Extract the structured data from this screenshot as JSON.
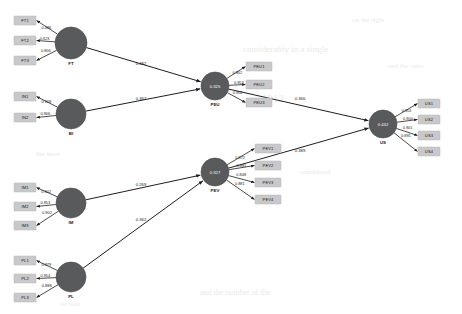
{
  "diagram": {
    "type": "pls-sem-path-model",
    "background_color": "#ffffff",
    "node_color": "#595a5c",
    "indicator_color": "#c9c9cb",
    "edge_color": "#1e1e20"
  },
  "ghost_text": [
    {
      "text": "on the right",
      "x": 352,
      "y": 16,
      "size": 7
    },
    {
      "text": "considerably in a single",
      "x": 243,
      "y": 44,
      "size": 9
    },
    {
      "text": "and the ratio",
      "x": 388,
      "y": 62,
      "size": 7
    },
    {
      "text": "1312",
      "x": 262,
      "y": 92,
      "size": 11
    },
    {
      "text": "the most",
      "x": 36,
      "y": 150,
      "size": 7
    },
    {
      "text": "considered",
      "x": 300,
      "y": 168,
      "size": 7
    },
    {
      "text": "and the number of the",
      "x": 200,
      "y": 288,
      "size": 8
    },
    {
      "text": "section",
      "x": 60,
      "y": 300,
      "size": 7
    }
  ],
  "constructs": [
    {
      "id": "FT",
      "label": "FT",
      "cx": 71,
      "cy": 43,
      "r": 16,
      "r2": null,
      "indicator_side": "left",
      "indicators": [
        {
          "label": "FT1",
          "loading": "0.486",
          "bx": 14,
          "by": 16
        },
        {
          "label": "FT2",
          "loading": "0.623",
          "bx": 14,
          "by": 36
        },
        {
          "label": "FT3",
          "loading": "0.806",
          "bx": 14,
          "by": 56
        }
      ]
    },
    {
      "id": "BI",
      "label": "BI",
      "cx": 71,
      "cy": 114,
      "r": 15,
      "r2": null,
      "indicator_side": "left",
      "indicators": [
        {
          "label": "IN1",
          "loading": "0.909",
          "bx": 14,
          "by": 92
        },
        {
          "label": "IN2",
          "loading": "0.906",
          "bx": 14,
          "by": 113
        }
      ]
    },
    {
      "id": "IM",
      "label": "IM",
      "cx": 71,
      "cy": 203,
      "r": 15,
      "r2": null,
      "indicator_side": "left",
      "indicators": [
        {
          "label": "IM1",
          "loading": "0.902",
          "bx": 14,
          "by": 183
        },
        {
          "label": "IM2",
          "loading": "0.853",
          "bx": 14,
          "by": 202
        },
        {
          "label": "IM3",
          "loading": "0.902",
          "bx": 14,
          "by": 221
        }
      ]
    },
    {
      "id": "PL",
      "label": "PL",
      "cx": 71,
      "cy": 277,
      "r": 15,
      "r2": null,
      "indicator_side": "left",
      "indicators": [
        {
          "label": "PL1",
          "loading": "0.879",
          "bx": 14,
          "by": 256
        },
        {
          "label": "PL2",
          "loading": "0.954",
          "bx": 14,
          "by": 274
        },
        {
          "label": "PL3",
          "loading": "0.888",
          "bx": 14,
          "by": 293
        }
      ]
    },
    {
      "id": "PEU",
      "label": "PEU",
      "cx": 215,
      "cy": 86,
      "r": 14,
      "r2": "0.325",
      "indicator_side": "right",
      "indicators": [
        {
          "label": "PEU1",
          "loading": "0.902",
          "bx": 246,
          "by": 62
        },
        {
          "label": "PEU2",
          "loading": "0.953",
          "bx": 246,
          "by": 80
        },
        {
          "label": "PEU3",
          "loading": "0.902",
          "bx": 246,
          "by": 98
        }
      ]
    },
    {
      "id": "PEV",
      "label": "PEV",
      "cx": 215,
      "cy": 172,
      "r": 14,
      "r2": "0.327",
      "indicator_side": "right",
      "indicators": [
        {
          "label": "PEV1",
          "loading": "0.872",
          "bx": 255,
          "by": 144
        },
        {
          "label": "PEV2",
          "loading": "0.881",
          "bx": 255,
          "by": 161
        },
        {
          "label": "PEV3",
          "loading": "0.848",
          "bx": 255,
          "by": 178
        },
        {
          "label": "PEV4",
          "loading": "0.881",
          "bx": 255,
          "by": 195
        }
      ]
    },
    {
      "id": "US",
      "label": "US",
      "cx": 383,
      "cy": 124,
      "r": 14,
      "r2": "0.432",
      "indicator_side": "right",
      "indicators": [
        {
          "label": "US1",
          "loading": "0.901",
          "bx": 418,
          "by": 99
        },
        {
          "label": "US2",
          "loading": "0.900",
          "bx": 418,
          "by": 115
        },
        {
          "label": "US3",
          "loading": "0.901",
          "bx": 418,
          "by": 131
        },
        {
          "label": "US4",
          "loading": "0.891",
          "bx": 418,
          "by": 147
        }
      ]
    }
  ],
  "paths": [
    {
      "from": "FT",
      "to": "PEU",
      "coefficient": "0.482",
      "lx": 141,
      "ly": 65
    },
    {
      "from": "BI",
      "to": "PEU",
      "coefficient": "0.367",
      "lx": 141,
      "ly": 100
    },
    {
      "from": "IM",
      "to": "PEV",
      "coefficient": "0.269",
      "lx": 141,
      "ly": 186
    },
    {
      "from": "PL",
      "to": "PEV",
      "coefficient": "0.362",
      "lx": 141,
      "ly": 221
    },
    {
      "from": "PEU",
      "to": "US",
      "coefficient": "0.366",
      "lx": 300,
      "ly": 100
    },
    {
      "from": "PEV",
      "to": "US",
      "coefficient": "0.389",
      "lx": 300,
      "ly": 152
    }
  ]
}
